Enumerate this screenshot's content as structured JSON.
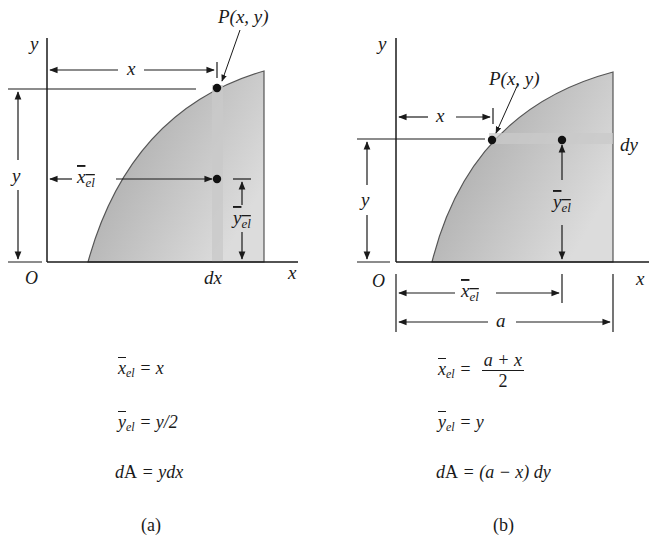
{
  "panel_a": {
    "labels": {
      "y_axis": "y",
      "x_axis": "x",
      "origin": "O",
      "point": "P(x, y)",
      "x_dim": "x",
      "y_dim": "y",
      "xbar_el": "x",
      "xbar_el_sub": "el",
      "ybar_el": "y",
      "ybar_el_sub": "el",
      "strip": "dx"
    },
    "equations": {
      "xbar_lhs": "x",
      "xbar_sub": "el",
      "xbar_rhs": " = x",
      "ybar_lhs": "y",
      "ybar_sub": "el",
      "ybar_rhs": " = y/2",
      "dA_lhs": "d",
      "dA_A": "A",
      "dA_rhs": " = ydx"
    },
    "caption": "(a)"
  },
  "panel_b": {
    "labels": {
      "y_axis": "y",
      "x_axis": "x",
      "origin": "O",
      "point": "P(x, y)",
      "x_dim": "x",
      "y_dim": "y",
      "xbar_el": "x",
      "xbar_el_sub": "el",
      "ybar_el": "y",
      "ybar_el_sub": "el",
      "strip": "dy",
      "a_dim": "a"
    },
    "equations": {
      "xbar_lhs": "x",
      "xbar_sub": "el",
      "xbar_eq": " = ",
      "xbar_num": "a + x",
      "xbar_den": "2",
      "ybar_lhs": "y",
      "ybar_sub": "el",
      "ybar_rhs": " = y",
      "dA_lhs": "d",
      "dA_A": "A",
      "dA_rhs": " = (a − x) dy"
    },
    "caption": "(b)"
  },
  "colors": {
    "fill_dark": "#a9a9a9",
    "fill_light": "#d8d8d8",
    "strip": "#c4c4c4",
    "line": "#1a1a1a"
  }
}
